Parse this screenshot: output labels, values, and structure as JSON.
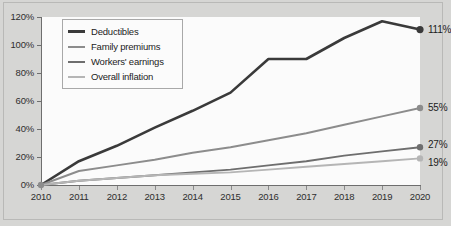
{
  "chart_data": {
    "type": "line",
    "title": "",
    "subtitle": "",
    "xlabel": "",
    "ylabel": "",
    "x": [
      2010,
      2011,
      2012,
      2013,
      2014,
      2015,
      2016,
      2017,
      2018,
      2019,
      2020
    ],
    "xtick_labels": [
      "2010",
      "2011",
      "2012",
      "2013",
      "2014",
      "2015",
      "2016",
      "2017",
      "2018",
      "2019",
      "2020"
    ],
    "ytick_labels": [
      "0%",
      "20%",
      "40%",
      "60%",
      "80%",
      "100%",
      "120%"
    ],
    "ytick_values": [
      0,
      20,
      40,
      60,
      80,
      100,
      120
    ],
    "ylim": [
      0,
      120
    ],
    "xlim": [
      2010,
      2020
    ],
    "grid": false,
    "legend_position": "top-left",
    "series": [
      {
        "name": "Deductibles",
        "color": "#3a3a3a",
        "width": 2.6,
        "values": [
          0,
          17,
          28,
          41,
          53,
          66,
          90,
          90,
          105,
          117,
          111
        ],
        "end_label": "111%",
        "marker_end": true
      },
      {
        "name": "Family premiums",
        "color": "#8c8c8c",
        "width": 1.9,
        "values": [
          0,
          10,
          14,
          18,
          23,
          27,
          32,
          37,
          43,
          49,
          55
        ],
        "end_label": "55%",
        "marker_end": true
      },
      {
        "name": "Workers' earnings",
        "color": "#6e6e6e",
        "width": 1.9,
        "values": [
          0,
          3,
          5,
          7,
          9,
          11,
          14,
          17,
          21,
          24,
          27
        ],
        "end_label": "27%",
        "marker_end": true
      },
      {
        "name": "Overall inflation",
        "color": "#b5b5b5",
        "width": 1.9,
        "values": [
          0,
          3,
          5,
          7,
          8,
          9,
          11,
          13,
          15,
          17,
          19
        ],
        "end_label": "19%",
        "marker_end": true
      }
    ],
    "origin_marker": {
      "x": 2010,
      "y": 0,
      "color": "#8c8c8c"
    }
  },
  "colors": {
    "page_background": "#d6d6d4",
    "plot_background": "#fbfbfb",
    "axis": "#6e6e6e",
    "frame": "#b9b9b7",
    "text": "#1c1c1c"
  }
}
